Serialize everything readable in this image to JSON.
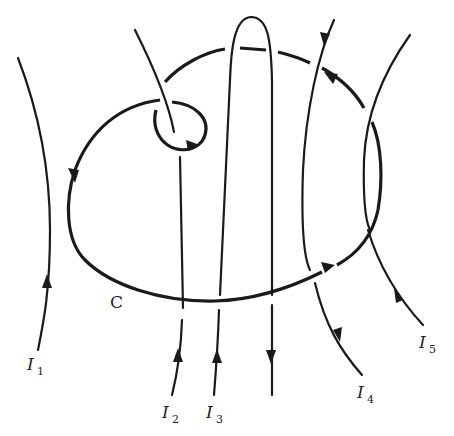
{
  "figure": {
    "loop": {
      "label": "C"
    },
    "currents": [
      {
        "id": "I1",
        "symbol": "I",
        "subscript": "1",
        "direction": "up"
      },
      {
        "id": "I2",
        "symbol": "I",
        "subscript": "2",
        "direction": "up"
      },
      {
        "id": "I3",
        "symbol": "I",
        "subscript": "3",
        "direction": "up-then-down (hairpin)"
      },
      {
        "id": "I4",
        "symbol": "I",
        "subscript": "4",
        "direction": "down"
      },
      {
        "id": "I5",
        "symbol": "I",
        "subscript": "5",
        "direction": "up"
      }
    ],
    "colors": {
      "stroke": "#1a1a1a",
      "background": "#ffffff"
    }
  }
}
